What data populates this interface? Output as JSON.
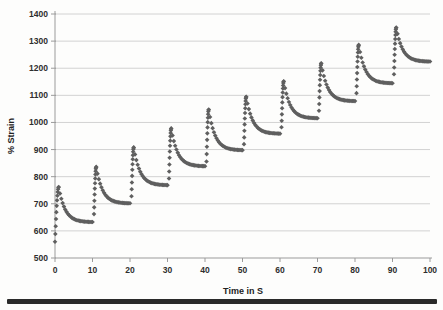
{
  "page": {
    "background": "#fdfdfc",
    "bottom_rule_color": "#2a2a2a"
  },
  "chart_data": {
    "type": "scatter",
    "title": "",
    "xlabel": "Time in S",
    "ylabel": "% Strain",
    "xlim": [
      0,
      100
    ],
    "ylim": [
      500,
      1400
    ],
    "x_ticks": [
      0,
      10,
      20,
      30,
      40,
      50,
      60,
      70,
      80,
      90,
      100
    ],
    "y_ticks": [
      500,
      600,
      700,
      800,
      900,
      1000,
      1100,
      1200,
      1300,
      1400
    ],
    "grid": "horizontal-gridlines-on",
    "legend": "none",
    "grid_color": "#d2d2d2",
    "axis_color": "#9b9b9b",
    "label_color": "#2e2e2e",
    "marker": {
      "shape": "diamond",
      "color": "#5f5f5f",
      "size_px": 4.6
    },
    "series": [
      {
        "name": "% Strain",
        "pattern": "ten repeated creep-recovery cycles: steep vertical rise at the start of each 10 s interval to a peak, then exponential decay to a plateau",
        "decay_tau_s": 1.7,
        "points_per_rise": 12,
        "points_per_decay": 26,
        "cycles": [
          {
            "t_start": 0.0,
            "t_peak": 1.0,
            "t_end": 10,
            "v_start": 560,
            "v_peak": 762,
            "v_end": 632
          },
          {
            "t_start": 10.4,
            "t_peak": 11.0,
            "t_end": 20,
            "v_start": 662,
            "v_peak": 836,
            "v_end": 701
          },
          {
            "t_start": 20.4,
            "t_peak": 21.0,
            "t_end": 30,
            "v_start": 728,
            "v_peak": 908,
            "v_end": 768
          },
          {
            "t_start": 30.4,
            "t_peak": 31.0,
            "t_end": 40,
            "v_start": 793,
            "v_peak": 978,
            "v_end": 838
          },
          {
            "t_start": 40.4,
            "t_peak": 41.0,
            "t_end": 50,
            "v_start": 856,
            "v_peak": 1048,
            "v_end": 897
          },
          {
            "t_start": 50.4,
            "t_peak": 51.0,
            "t_end": 60,
            "v_start": 920,
            "v_peak": 1095,
            "v_end": 958
          },
          {
            "t_start": 60.4,
            "t_peak": 61.0,
            "t_end": 70,
            "v_start": 982,
            "v_peak": 1152,
            "v_end": 1015
          },
          {
            "t_start": 70.4,
            "t_peak": 71.0,
            "t_end": 80,
            "v_start": 1043,
            "v_peak": 1218,
            "v_end": 1078
          },
          {
            "t_start": 80.4,
            "t_peak": 81.0,
            "t_end": 90,
            "v_start": 1108,
            "v_peak": 1286,
            "v_end": 1144
          },
          {
            "t_start": 90.4,
            "t_peak": 91.0,
            "t_end": 100,
            "v_start": 1178,
            "v_peak": 1350,
            "v_end": 1224
          }
        ]
      }
    ]
  }
}
